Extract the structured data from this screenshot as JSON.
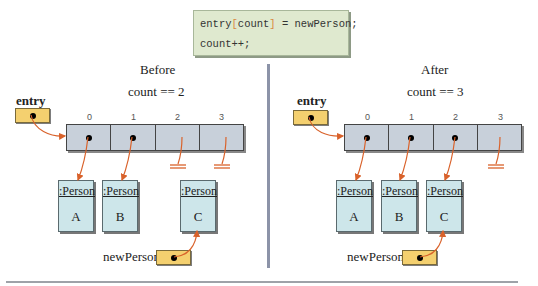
{
  "code": {
    "line1_prefix": "entry",
    "line1_bracket_open": "[",
    "line1_index": "count",
    "line1_bracket_close": "]",
    "line1_suffix": " = newPerson;",
    "line2": "count++;"
  },
  "before": {
    "title": "Before",
    "count_label": "count == 2",
    "entry_label": "entry",
    "indices": [
      "0",
      "1",
      "2",
      "3"
    ],
    "cells": [
      "ref",
      "ref",
      "null",
      "null"
    ],
    "persons": [
      {
        "class": ":Person",
        "name": "A"
      },
      {
        "class": ":Person",
        "name": "B"
      },
      {
        "class": ":Person",
        "name": "C"
      }
    ],
    "newperson_label": "newPerson"
  },
  "after": {
    "title": "After",
    "count_label": "count == 3",
    "entry_label": "entry",
    "indices": [
      "0",
      "1",
      "2",
      "3"
    ],
    "cells": [
      "ref",
      "ref",
      "ref",
      "null"
    ],
    "persons": [
      {
        "class": ":Person",
        "name": "A"
      },
      {
        "class": ":Person",
        "name": "B"
      },
      {
        "class": ":Person",
        "name": "C"
      }
    ],
    "newperson_label": "newPerson"
  },
  "colors": {
    "arrow": "#d9622b",
    "ref_box": "#f4d06f",
    "array_cell": "#c8d0da",
    "person_box": "#cde6ea",
    "code_bg": "#dfe9cf",
    "divider": "#8c93a8"
  }
}
